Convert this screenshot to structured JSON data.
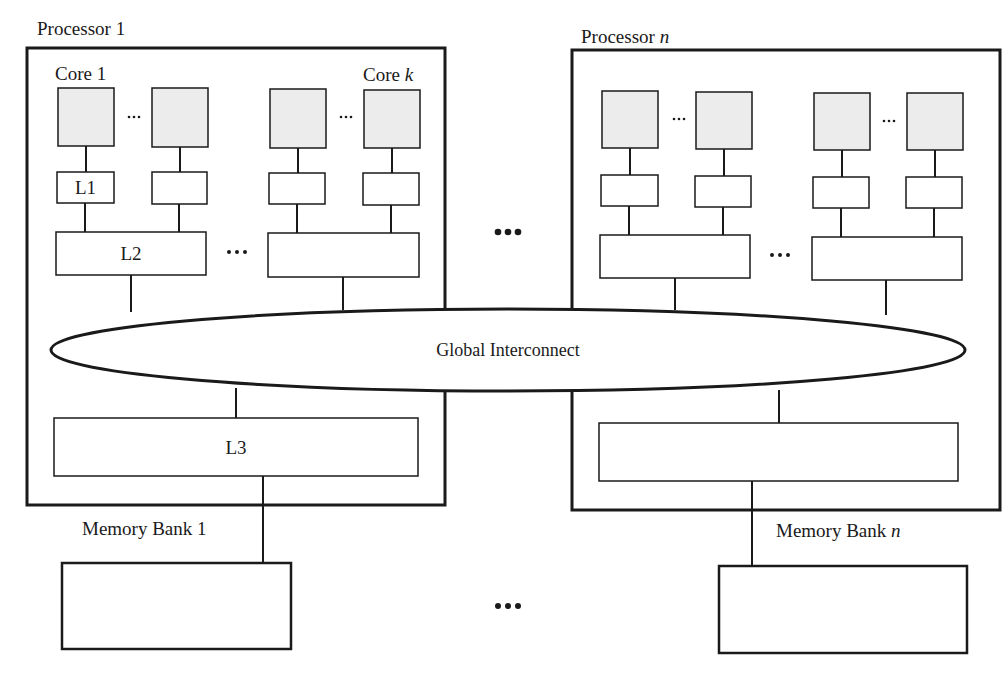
{
  "diagram": {
    "title_fragment": "",
    "processors": [
      {
        "label": "Processor 1",
        "label_var": "",
        "core_first_label": "Core 1",
        "core_last_label_prefix": "Core ",
        "core_last_label_var": "k",
        "l1_label": "L1",
        "l2_label": "L2",
        "l3_label": "L3"
      },
      {
        "label": "Processor ",
        "label_var": "n",
        "core_first_label": "",
        "core_last_label_prefix": "",
        "core_last_label_var": "",
        "l1_label": "",
        "l2_label": "",
        "l3_label": ""
      }
    ],
    "interconnect_label": "Global Interconnect",
    "memory_banks": [
      {
        "label": "Memory Bank 1",
        "label_var": ""
      },
      {
        "label": "Memory Bank ",
        "label_var": "n"
      }
    ],
    "ellipsis_small": "···",
    "ellipsis_large": "•••",
    "colors": {
      "stroke": "#1a1a1a",
      "core_fill": "#ececec",
      "background": "#ffffff"
    }
  }
}
